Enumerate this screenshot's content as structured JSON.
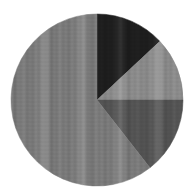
{
  "figure": {
    "title": "",
    "background_color": "#ffffff",
    "width": 191,
    "height": 196
  },
  "chart_data": {
    "type": "pie",
    "title": "",
    "subtitle": "",
    "xlabel": "",
    "ylabel": "",
    "legend": false,
    "legend_position": "none",
    "grid": false,
    "labels_shown": false,
    "start_angle_deg": 0,
    "direction": "clockwise",
    "center_x": 97,
    "center_y": 100,
    "radius": 86,
    "categories": [
      "Slice 1",
      "Slice 2",
      "Slice 3",
      "Slice 4"
    ],
    "values": [
      13,
      12,
      14,
      61
    ],
    "units": "percent",
    "total": 100,
    "slices": [
      {
        "name": "Slice 1",
        "value": 13,
        "percent": "13%",
        "angle_start_deg": 0,
        "angle_end_deg": 47,
        "sweep_deg": 47,
        "color": "#1f1f1f"
      },
      {
        "name": "Slice 2",
        "value": 12,
        "percent": "12%",
        "angle_start_deg": 47,
        "angle_end_deg": 90,
        "sweep_deg": 43,
        "color": "#8d8d8d"
      },
      {
        "name": "Slice 3",
        "value": 14,
        "percent": "14%",
        "angle_start_deg": 90,
        "angle_end_deg": 142,
        "sweep_deg": 52,
        "color": "#565656"
      },
      {
        "name": "Slice 4",
        "value": 61,
        "percent": "61%",
        "angle_start_deg": 142,
        "angle_end_deg": 360,
        "sweep_deg": 218,
        "color": "#7d7d7d"
      }
    ],
    "colors": [
      "#1f1f1f",
      "#8d8d8d",
      "#565656",
      "#7d7d7d"
    ],
    "annotations": []
  }
}
